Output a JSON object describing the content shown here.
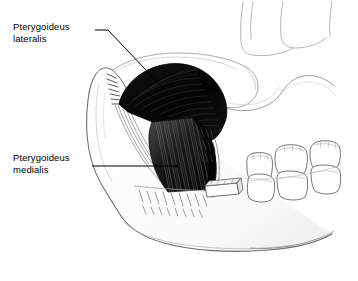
{
  "figure": {
    "background_color": "#ffffff",
    "ink_color": "#000000",
    "width": 358,
    "height": 281
  },
  "labels": [
    {
      "id": "pterygoideus-lateralis",
      "line1": "Pterygoideus",
      "line2": "lateralis",
      "text_x": 13,
      "text_y": 21,
      "leader": {
        "start_x": 95,
        "start_y": 30,
        "bend_x": 108,
        "bend_y": 30,
        "end_x": 163,
        "end_y": 88,
        "dot_radius": 1.6
      }
    },
    {
      "id": "pterygoideus-medialis",
      "line1": "Pterygoideus",
      "line2": "medialis",
      "text_x": 13,
      "text_y": 152,
      "leader": {
        "start_x": 92,
        "start_y": 166,
        "bend_x": 110,
        "bend_y": 166,
        "end_x": 176,
        "end_y": 166,
        "dot_radius": 1.6
      }
    }
  ],
  "structures": {
    "lateral_pterygoid": {
      "name": "Pterygoideus lateralis",
      "fill": "#0a0a0a",
      "description": "Dark fan-shaped muscle mass filling infratemporal fossa, fibers run antero-posteriorly toward condyle"
    },
    "medial_pterygoid": {
      "name": "Pterygoideus medialis",
      "fill": "#2b2b2b",
      "description": "Striated quadrilateral muscle descending obliquely to the mandibular angle"
    },
    "mandible": {
      "name": "Mandible (ramus, body, coronoid process, angle)",
      "fill": "#fdfdfd",
      "stroke": "#6a6a6a",
      "description": "Outline of hemimandible shown in left lateral aspect with cut bone hatching"
    },
    "skull": {
      "name": "Skull base / zygomatic arch / maxilla",
      "fill": "#ffffff",
      "stroke": "#9a9a9a",
      "description": "Faint outline of cranium, zygomatic arch and maxillary tuberosity"
    },
    "teeth": {
      "name": "Molar teeth",
      "count_upper": 3,
      "count_lower": 3,
      "fill": "#ffffff",
      "stroke": "#6f6f6f",
      "description": "Upper and lower molar rows at the right of the figure"
    },
    "temporalis_tendon": {
      "name": "Temporalis tendon",
      "stroke": "#7d7d7d",
      "description": "Thin banded tendon running from coronoid process downward"
    },
    "cut_hatching": {
      "name": "Cut bone hatching",
      "stroke": "#8a8a8a",
      "description": "Short oblique strokes indicating sectioned bone on the mandibular body"
    }
  }
}
